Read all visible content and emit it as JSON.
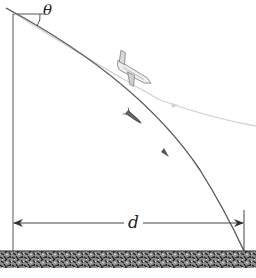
{
  "figure": {
    "type": "physics-diagram",
    "labels": {
      "angle": "θ",
      "distance": "d"
    },
    "colors": {
      "line": "#444444",
      "trajectory": "#5a5a5a",
      "plane_path": "#c8c8c8",
      "ground_dark": "#2a2a2a",
      "ground_light": "#9a9a9a"
    },
    "elements": [
      "vertical-reference-line",
      "horizontal-reference-line",
      "angle-arc",
      "airplane",
      "airplane-path",
      "package-trajectory",
      "package",
      "distance-arrow",
      "ground"
    ]
  }
}
